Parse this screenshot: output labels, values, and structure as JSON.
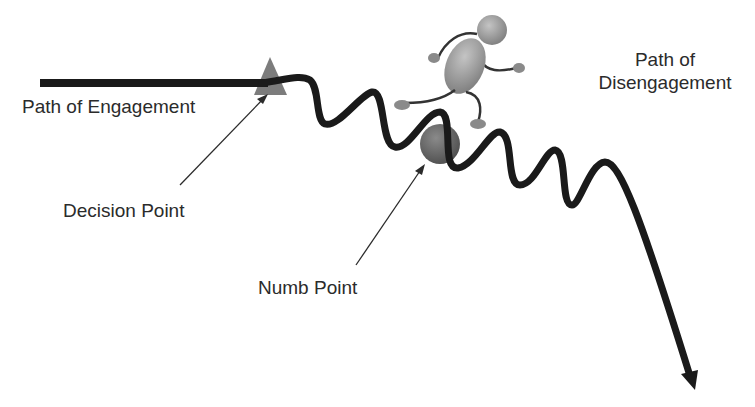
{
  "diagram": {
    "labels": {
      "engagement": "Path of Engagement",
      "disengagement_line1": "Path of",
      "disengagement_line2": "Disengagement",
      "decision": "Decision Point",
      "numb": "Numb Point"
    },
    "icons": {
      "decision_marker": "triangle",
      "numb_marker": "circle",
      "figure": "running-stick-figure",
      "path_end": "arrowhead"
    },
    "colors": {
      "path": "#1a1a1a",
      "marker": "#6e6e6e",
      "figure": "#9a9a9a",
      "text": "#2b2b2b",
      "background": "#ffffff"
    }
  }
}
